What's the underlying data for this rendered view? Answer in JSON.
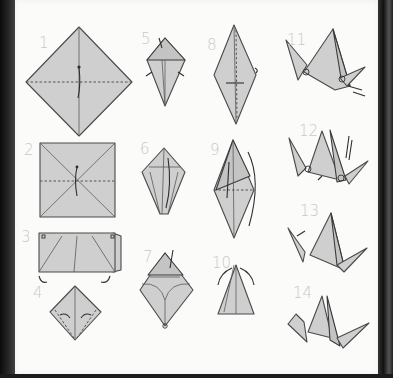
{
  "colors": {
    "paper": "#fbfbfa",
    "fold_fill": "#cfcfcf",
    "outline": "#4a4a4a",
    "step_number": "#c9c9c9",
    "background": "#1a1a1a"
  },
  "steps": [
    {
      "number": "1",
      "description": "Square on point, diagonal fold line, arrow folding up"
    },
    {
      "number": "2",
      "description": "Square with diagonal creases and horizontal dashed fold"
    },
    {
      "number": "3",
      "description": "Folded rectangle with corners to collapse"
    },
    {
      "number": "4",
      "description": "Square base with dashed fold lines to center"
    },
    {
      "number": "5",
      "description": "Kite shape with top flap folded down"
    },
    {
      "number": "6",
      "description": "Diamond with petal fold arrow"
    },
    {
      "number": "7",
      "description": "Petal fold opened"
    },
    {
      "number": "8",
      "description": "Bird base, long diamond with dotted centre crease"
    },
    {
      "number": "9",
      "description": "Fold edges to centre, flip over"
    },
    {
      "number": "10",
      "description": "Narrow legs, inside reverse fold arrows"
    },
    {
      "number": "11",
      "description": "Crane with neck and tail reverse folded"
    },
    {
      "number": "12",
      "description": "Crane with head fold indicated"
    },
    {
      "number": "13",
      "description": "Crane with head reverse fold"
    },
    {
      "number": "14",
      "description": "Finished crane"
    }
  ]
}
